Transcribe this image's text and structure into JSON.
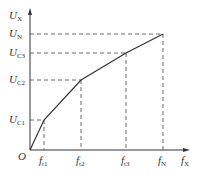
{
  "diagram": {
    "type": "piecewise-linear V/f curve",
    "y_axis_label": {
      "main": "U",
      "sub": "X"
    },
    "x_axis_label": {
      "main": "f",
      "sub": "X"
    },
    "origin_label": "O",
    "y_ticks": [
      {
        "main": "U",
        "sub": "N"
      },
      {
        "main": "U",
        "sub": "C3"
      },
      {
        "main": "U",
        "sub": "C2"
      },
      {
        "main": "U",
        "sub": "C1"
      }
    ],
    "x_ticks": [
      {
        "main": "f",
        "sub": "t1"
      },
      {
        "main": "f",
        "sub": "t2"
      },
      {
        "main": "f",
        "sub": "t3"
      },
      {
        "main": "f",
        "sub": "N"
      }
    ],
    "points": [
      {
        "name": "origin",
        "x": "0",
        "y": "0"
      },
      {
        "name": "P1",
        "x": "ft1",
        "y": "UC1"
      },
      {
        "name": "P2",
        "x": "ft2",
        "y": "UC2"
      },
      {
        "name": "P3",
        "x": "ft3",
        "y": "UC3"
      },
      {
        "name": "P4",
        "x": "fN",
        "y": "UN"
      }
    ]
  }
}
